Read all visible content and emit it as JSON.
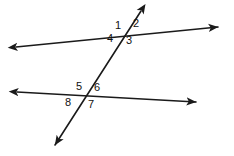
{
  "diagram": {
    "kind": "geometry-figure",
    "canvas": {
      "width": 234,
      "height": 156
    },
    "colors": {
      "background": "#ffffff",
      "stroke": "#1a1a1a",
      "label_text": "#111111"
    },
    "stroke_width": 1.6,
    "lines": [
      {
        "name": "upper-parallel-line",
        "x1": 16,
        "y1": 47,
        "x2": 218,
        "y2": 27,
        "arrow_start": true,
        "arrow_end": true
      },
      {
        "name": "lower-parallel-line",
        "x1": 17,
        "y1": 92,
        "x2": 196,
        "y2": 102,
        "arrow_start": true,
        "arrow_end": true
      },
      {
        "name": "transversal-line",
        "x1": 141,
        "y1": 11,
        "x2": 55,
        "y2": 145,
        "arrow_start": true,
        "arrow_end": true
      }
    ],
    "intersections": [
      {
        "name": "upper-intersection",
        "x": 123,
        "y": 32
      },
      {
        "name": "lower-intersection",
        "x": 85,
        "y": 95
      }
    ],
    "angle_labels": [
      {
        "id": "angle-1",
        "text": "1",
        "x": 115,
        "y": 20,
        "at": "upper-intersection",
        "position": "upper-left"
      },
      {
        "id": "angle-2",
        "text": "2",
        "x": 133,
        "y": 18,
        "at": "upper-intersection",
        "position": "upper-right"
      },
      {
        "id": "angle-3",
        "text": "3",
        "x": 126,
        "y": 35,
        "at": "upper-intersection",
        "position": "lower-right"
      },
      {
        "id": "angle-4",
        "text": "4",
        "x": 107,
        "y": 33,
        "at": "upper-intersection",
        "position": "lower-left"
      },
      {
        "id": "angle-5",
        "text": "5",
        "x": 76,
        "y": 81,
        "at": "lower-intersection",
        "position": "upper-left"
      },
      {
        "id": "angle-6",
        "text": "6",
        "x": 94,
        "y": 82,
        "at": "lower-intersection",
        "position": "upper-right"
      },
      {
        "id": "angle-7",
        "text": "7",
        "x": 88,
        "y": 99,
        "at": "lower-intersection",
        "position": "lower-right"
      },
      {
        "id": "angle-8",
        "text": "8",
        "x": 65,
        "y": 97,
        "at": "lower-intersection",
        "position": "lower-left"
      }
    ]
  }
}
